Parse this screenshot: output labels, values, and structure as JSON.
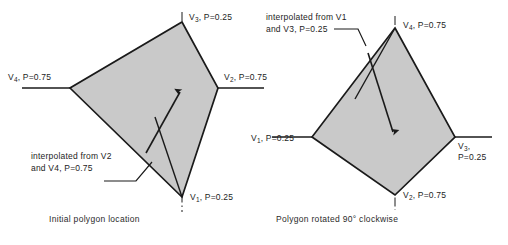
{
  "figure": {
    "background_color": "#ffffff",
    "polygon_fill_color": "#c9c9c9",
    "polygon_stroke_color": "#1a1a1a",
    "axis_color": "#1a1a1a",
    "panels": [
      {
        "id": "initial",
        "caption": "Initial polygon location",
        "vertex_labels": {
          "top": {
            "name": "V",
            "index": "3",
            "value": ", P=0.25"
          },
          "left": {
            "name": "V",
            "index": "4",
            "value": ", P=0.75"
          },
          "right": {
            "name": "V",
            "index": "2",
            "value": ", P=0.75"
          },
          "bottom": {
            "name": "V",
            "index": "1",
            "value": ", P=0.25"
          }
        },
        "annotation": {
          "line1_prefix": "interpolated from V",
          "line1_index": "2",
          "line2_prefix": "and V",
          "line2_index": "4",
          "line2_suffix": ", P=0.75"
        }
      },
      {
        "id": "rotated",
        "caption": "Polygon rotated 90° clockwise",
        "vertex_labels": {
          "top": {
            "name": "V",
            "index": "4",
            "value": ", P=0.75"
          },
          "left": {
            "name": "V",
            "index": "1",
            "value": ", P=0.25"
          },
          "right_line1": {
            "name": "V",
            "index": "3",
            "value": ","
          },
          "right_line2": {
            "value": "P=0.25"
          },
          "bottom": {
            "name": "V",
            "index": "2",
            "value": ", P=0.75"
          }
        },
        "annotation": {
          "line1_prefix": "interpolated from V",
          "line1_index": "1",
          "line2_prefix": "and V",
          "line2_index": "3",
          "line2_suffix": ", P=0.25"
        }
      }
    ]
  }
}
